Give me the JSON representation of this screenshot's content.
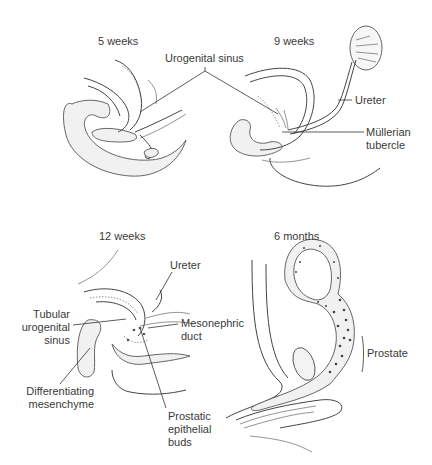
{
  "figure": {
    "panels": [
      {
        "id": "5w",
        "title": "5 weeks"
      },
      {
        "id": "9w",
        "title": "9 weeks"
      },
      {
        "id": "12w",
        "title": "12 weeks"
      },
      {
        "id": "6m",
        "title": "6 months"
      }
    ],
    "labels": {
      "urogenital_sinus": "Urogenital sinus",
      "ureter_9w": "Ureter",
      "mullerian_tubercle": [
        "Müllerian",
        "tubercle"
      ],
      "ureter_12w": "Ureter",
      "tubular_urogenital_sinus": [
        "Tubular",
        "urogenital",
        "sinus"
      ],
      "mesonephric_duct": [
        "Mesonephric",
        "duct"
      ],
      "differentiating_mesenchyme": [
        "Differentiating",
        "mesenchyme"
      ],
      "prostatic_epithelial_buds": [
        "Prostatic",
        "epithelial",
        "buds"
      ],
      "prostate": "Prostate"
    }
  }
}
